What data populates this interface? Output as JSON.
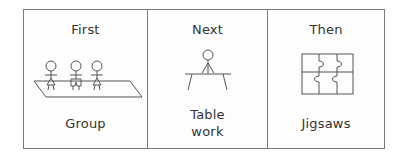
{
  "schedule": {
    "steps": [
      {
        "heading": "First",
        "label": "Group",
        "icon": "group-of-people-icon"
      },
      {
        "heading": "Next",
        "label_lines": [
          "Table",
          "work"
        ],
        "icon": "person-at-table-icon"
      },
      {
        "heading": "Then",
        "label": "Jigsaws",
        "icon": "jigsaw-puzzle-icon"
      }
    ]
  },
  "colors": {
    "line": "#555555",
    "border": "#7a7a7a",
    "text": "#333333"
  }
}
